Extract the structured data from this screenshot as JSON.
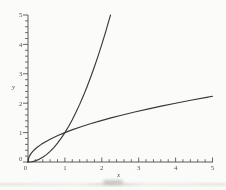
{
  "chart_data": {
    "type": "line",
    "title": "",
    "xlabel": "x",
    "ylabel": "y",
    "xlim": [
      0,
      5
    ],
    "ylim": [
      0,
      5
    ],
    "x_ticks": [
      0,
      1,
      2,
      3,
      4,
      5
    ],
    "y_ticks": [
      0,
      1,
      2,
      3,
      4,
      5
    ],
    "minor_tick_step": 0.2,
    "grid": false,
    "legend_position": "none",
    "axis_color": "#4a4a4a",
    "curve_color": "#383838",
    "tick_label_color": "#4f4f4f",
    "series": [
      {
        "name": "x-squared",
        "points": [
          [
            0,
            0
          ],
          [
            0.1,
            0.01
          ],
          [
            0.2,
            0.04
          ],
          [
            0.3,
            0.09
          ],
          [
            0.4,
            0.16
          ],
          [
            0.5,
            0.25
          ],
          [
            0.6,
            0.36
          ],
          [
            0.7,
            0.49
          ],
          [
            0.8,
            0.64
          ],
          [
            0.9,
            0.81
          ],
          [
            1,
            1
          ],
          [
            1.1,
            1.21
          ],
          [
            1.2,
            1.44
          ],
          [
            1.3,
            1.69
          ],
          [
            1.4,
            1.96
          ],
          [
            1.5,
            2.25
          ],
          [
            1.6,
            2.56
          ],
          [
            1.7,
            2.89
          ],
          [
            1.8,
            3.24
          ],
          [
            1.9,
            3.61
          ],
          [
            2,
            4
          ],
          [
            2.1,
            4.41
          ],
          [
            2.2,
            4.84
          ],
          [
            2.236,
            5
          ]
        ]
      },
      {
        "name": "sqrt-x",
        "points": [
          [
            0,
            0
          ],
          [
            0.01,
            0.1
          ],
          [
            0.04,
            0.2
          ],
          [
            0.09,
            0.3
          ],
          [
            0.16,
            0.4
          ],
          [
            0.25,
            0.5
          ],
          [
            0.36,
            0.6
          ],
          [
            0.49,
            0.7
          ],
          [
            0.64,
            0.8
          ],
          [
            0.81,
            0.9
          ],
          [
            1,
            1
          ],
          [
            1.21,
            1.1
          ],
          [
            1.44,
            1.2
          ],
          [
            1.69,
            1.3
          ],
          [
            1.96,
            1.4
          ],
          [
            2.25,
            1.5
          ],
          [
            2.56,
            1.6
          ],
          [
            2.89,
            1.7
          ],
          [
            3.24,
            1.8
          ],
          [
            3.61,
            1.9
          ],
          [
            4,
            2
          ],
          [
            4.41,
            2.1
          ],
          [
            4.84,
            2.2
          ],
          [
            5,
            2.236
          ]
        ]
      }
    ]
  }
}
